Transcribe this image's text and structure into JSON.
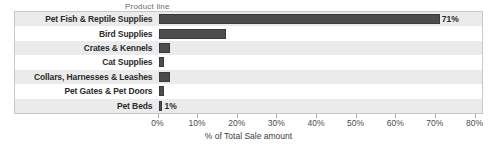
{
  "chart_data": {
    "type": "bar",
    "orientation": "horizontal",
    "title": "",
    "ylabel": "Product line",
    "xlabel": "% of Total Sale amount",
    "categories": [
      "Pet Fish & Reptile Supplies",
      "Bird Supplies",
      "Crates & Kennels",
      "Cat Supplies",
      "Collars, Harnesses & Leashes",
      "Pet Gates & Pet Doors",
      "Pet Beds"
    ],
    "values": [
      71,
      17,
      3,
      1.5,
      3,
      1.5,
      1
    ],
    "value_labels": [
      "71%",
      "",
      "",
      "",
      "",
      "",
      "1%"
    ],
    "xlim": [
      0,
      80
    ],
    "xticks": [
      0,
      10,
      20,
      30,
      40,
      50,
      60,
      70,
      80
    ],
    "xtick_labels": [
      "0%",
      "10%",
      "20%",
      "30%",
      "40%",
      "50%",
      "60%",
      "70%",
      "80%"
    ],
    "grid": false,
    "legend": "none",
    "bar_color": "#4d4d4d",
    "stripe_color": "#ebebeb",
    "background_color": "#ffffff"
  }
}
